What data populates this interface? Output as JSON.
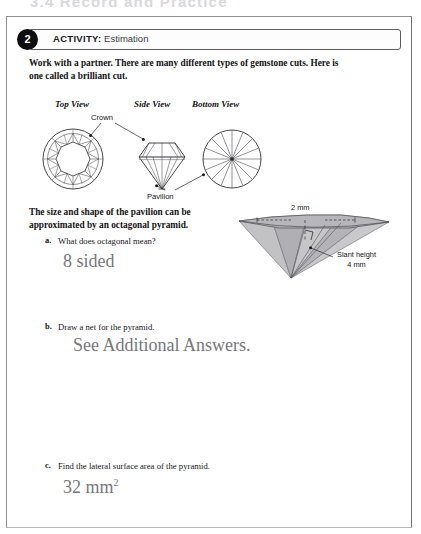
{
  "page_header": {
    "text": "3.4 Record and Practice"
  },
  "activity": {
    "number": "2",
    "keyword": "ACTIVITY:",
    "subtitle": "Estimation"
  },
  "intro": {
    "text": "Work with a partner. There are many different types of gemstone cuts. Here is one called a brilliant cut."
  },
  "gem_figure": {
    "view_titles": {
      "top": "Top View",
      "side": "Side View",
      "bottom": "Bottom View"
    },
    "callouts": {
      "crown": "Crown",
      "pavilion": "Pavilion"
    }
  },
  "pavilion_statement": {
    "text": "The size and shape of the pavilion can be approximated by an octagonal pyramid."
  },
  "pyramid_figure": {
    "top_dimension": "2 mm",
    "slant_height_label": "Slant height",
    "slant_height_value": "4 mm"
  },
  "questions": [
    {
      "letter": "a.",
      "text": "What does octagonal mean?",
      "answer": "8 sided",
      "answer_exponent": ""
    },
    {
      "letter": "b.",
      "text": "Draw a net for the pyramid.",
      "answer": "See Additional Answers.",
      "answer_exponent": ""
    },
    {
      "letter": "c.",
      "text": "Find the lateral surface area of the pyramid.",
      "answer": "32 mm",
      "answer_exponent": "2"
    }
  ],
  "colors": {
    "ink": "#121214",
    "answer_ink": "#77777c",
    "badge": "#0d0d0f",
    "gem_line": "#3c3c40",
    "pyramid_fill": "#b9b9bc"
  }
}
